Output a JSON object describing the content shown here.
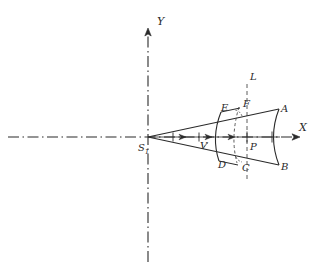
{
  "figure": {
    "width": 329,
    "height": 276,
    "background_color": "#ffffff",
    "stroke_color": "#2a2a2a"
  },
  "axes": {
    "x_axis": {
      "label": "X",
      "style": "dash-dot",
      "y_position": 137,
      "x_start": 8,
      "x_end": 305,
      "arrow": "right"
    },
    "y_axis": {
      "label": "Y",
      "style": "dash-dot",
      "x_position": 148,
      "y_start": 262,
      "y_end": 22,
      "arrow": "up"
    },
    "origin": {
      "label": "S",
      "subscript": "1",
      "x": 148,
      "y": 137
    }
  },
  "construction_line": {
    "label": "L",
    "style": "dashed",
    "x_position": 247,
    "y_top": 92,
    "y_bottom": 178
  },
  "cone": {
    "apex_x": 148,
    "apex_y": 137,
    "upper_ray_end_x": 278,
    "upper_ray_end_y": 110,
    "lower_ray_end_x": 278,
    "lower_ray_end_y": 164
  },
  "wavefronts": [
    {
      "name": "inner-arc-DVE",
      "from": "D",
      "through": "V",
      "to": "E"
    },
    {
      "name": "outer-arc-CPF",
      "from": "C",
      "through": "P",
      "to": "F"
    },
    {
      "name": "far-arc-BA",
      "from": "B",
      "through": "axis",
      "to": "A"
    }
  ],
  "points": [
    {
      "id": "A",
      "label": "A",
      "x": 281,
      "y": 104
    },
    {
      "id": "B",
      "label": "B",
      "x": 281,
      "y": 166
    },
    {
      "id": "C",
      "label": "C",
      "x": 242,
      "y": 166
    },
    {
      "id": "D",
      "label": "D",
      "x": 219,
      "y": 161
    },
    {
      "id": "E",
      "label": "E",
      "x": 222,
      "y": 106
    },
    {
      "id": "F",
      "label": "F",
      "x": 243,
      "y": 102
    },
    {
      "id": "L",
      "label": "L",
      "x": 250,
      "y": 74
    },
    {
      "id": "P",
      "label": "P",
      "x": 250,
      "y": 143
    },
    {
      "id": "V",
      "label": "V",
      "x": 203,
      "y": 143
    }
  ],
  "propagation_arrows": {
    "count": 3,
    "direction": "right",
    "along": "central-axis",
    "x_positions": [
      186,
      212,
      233
    ],
    "y": 137
  },
  "angle_arcs": {
    "count": 2,
    "description": "small arcs marking angle at F and at C against line L"
  }
}
